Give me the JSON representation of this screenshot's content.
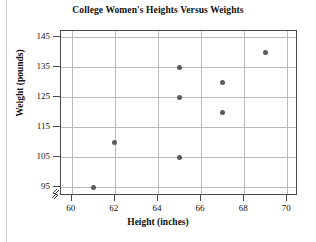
{
  "chart_data": {
    "type": "scatter",
    "title": "College Women's Heights Versus Weights",
    "xlabel": "Height (inches)",
    "ylabel": "Weight (pounds)",
    "xlim": [
      59.5,
      70.5
    ],
    "ylim": [
      92,
      147
    ],
    "xticks": [
      60,
      62,
      64,
      66,
      68,
      70
    ],
    "yticks": [
      95,
      105,
      115,
      125,
      135,
      145
    ],
    "xtick_labels": [
      "60",
      "62",
      "64",
      "66",
      "68",
      "70"
    ],
    "ytick_labels": [
      "95",
      "105",
      "115",
      "125",
      "135",
      "145"
    ],
    "grid": true,
    "legend": "none",
    "axis_break": true,
    "point_color": "#5b5b5b",
    "grid_color": "#b9b9b9",
    "axis_color": "#4a4a4a",
    "points": [
      {
        "x": 61,
        "y": 95
      },
      {
        "x": 62,
        "y": 110
      },
      {
        "x": 65,
        "y": 105
      },
      {
        "x": 65,
        "y": 125
      },
      {
        "x": 65,
        "y": 135
      },
      {
        "x": 67,
        "y": 120
      },
      {
        "x": 67,
        "y": 130
      },
      {
        "x": 69,
        "y": 140
      }
    ]
  }
}
